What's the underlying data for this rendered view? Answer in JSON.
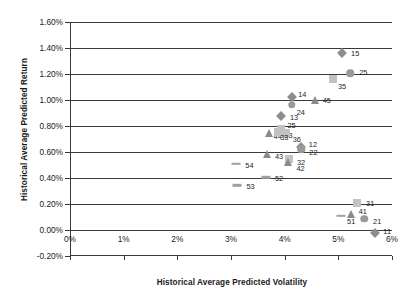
{
  "chart_data": {
    "type": "scatter",
    "title": "",
    "xlabel": "Historical Average Predicted Volatility",
    "ylabel": "Historical Average Predicted Return",
    "xlim": [
      0,
      6
    ],
    "ylim": [
      -0.2,
      1.6
    ],
    "xticks": [
      "0%",
      "1%",
      "2%",
      "3%",
      "4%",
      "5%",
      "6%"
    ],
    "xtick_values": [
      0,
      1,
      2,
      3,
      4,
      5,
      6
    ],
    "yticks": [
      "1.60%",
      "1.40%",
      "1.20%",
      "1.00%",
      "0.80%",
      "0.60%",
      "0.40%",
      "0.20%",
      "0.00%",
      "-0.20%"
    ],
    "ytick_values": [
      1.6,
      1.4,
      1.2,
      1.0,
      0.8,
      0.6,
      0.4,
      0.2,
      0.0,
      -0.2
    ],
    "grid": "horizontal",
    "legend": "none",
    "marker_shapes": {
      "1": "diamond",
      "2": "circle",
      "3": "square",
      "4": "triangle",
      "5": "dash"
    },
    "points": [
      {
        "label": "15",
        "x": 5.07,
        "y": 1.365,
        "shape": "diamond",
        "label_dx": 9,
        "label_dy": 0
      },
      {
        "label": "25",
        "x": 5.22,
        "y": 1.205,
        "shape": "circle",
        "label_dx": 9,
        "label_dy": -1
      },
      {
        "label": "35",
        "x": 4.9,
        "y": 1.16,
        "shape": "square",
        "label_dx": 5,
        "label_dy": 7
      },
      {
        "label": "14",
        "x": 4.14,
        "y": 1.02,
        "shape": "diamond",
        "label_dx": 6,
        "label_dy": -3
      },
      {
        "label": "45",
        "x": 4.56,
        "y": 1.0,
        "shape": "triangle",
        "label_dx": 8,
        "label_dy": 0
      },
      {
        "label": "24",
        "x": 4.13,
        "y": 0.965,
        "shape": "circle",
        "label_dx": 5,
        "label_dy": 7
      },
      {
        "label": "13",
        "x": 3.93,
        "y": 0.88,
        "shape": "diamond",
        "label_dx": 9,
        "label_dy": 1
      },
      {
        "label": "23",
        "x": 3.92,
        "y": 0.765,
        "shape": "circle",
        "label_dx": 4,
        "label_dy": 4
      },
      {
        "label": "25b",
        "x": 3.94,
        "y": 0.775,
        "shape": "square",
        "label_dx": 6,
        "label_dy": -4
      },
      {
        "label": "44",
        "x": 3.7,
        "y": 0.75,
        "shape": "triangle",
        "label_dx": 5,
        "label_dy": 3
      },
      {
        "label": "36",
        "x": 4.02,
        "y": 0.745,
        "shape": "square",
        "label_dx": 7,
        "label_dy": 6
      },
      {
        "label": "33",
        "x": 3.88,
        "y": 0.755,
        "shape": "square",
        "label_dx": 2,
        "label_dy": 5
      },
      {
        "label": "12",
        "x": 4.3,
        "y": 0.635,
        "shape": "diamond",
        "label_dx": 8,
        "label_dy": -3
      },
      {
        "label": "22",
        "x": 4.31,
        "y": 0.62,
        "shape": "circle",
        "label_dx": 8,
        "label_dy": 3
      },
      {
        "label": "43",
        "x": 3.67,
        "y": 0.585,
        "shape": "triangle",
        "label_dx": 8,
        "label_dy": 2
      },
      {
        "label": "32",
        "x": 4.08,
        "y": 0.545,
        "shape": "square",
        "label_dx": 8,
        "label_dy": 3
      },
      {
        "label": "42",
        "x": 4.07,
        "y": 0.525,
        "shape": "triangle",
        "label_dx": 8,
        "label_dy": 6
      },
      {
        "label": "54",
        "x": 3.1,
        "y": 0.51,
        "shape": "dash",
        "label_dx": 9,
        "label_dy": 1
      },
      {
        "label": "52",
        "x": 3.65,
        "y": 0.405,
        "shape": "dash",
        "label_dx": 9,
        "label_dy": 1
      },
      {
        "label": "53",
        "x": 3.12,
        "y": 0.345,
        "shape": "dash",
        "label_dx": 9,
        "label_dy": 1
      },
      {
        "label": "31",
        "x": 5.35,
        "y": 0.205,
        "shape": "square",
        "label_dx": 9,
        "label_dy": 0
      },
      {
        "label": "41",
        "x": 5.23,
        "y": 0.125,
        "shape": "triangle",
        "label_dx": 8,
        "label_dy": -3
      },
      {
        "label": "51",
        "x": 5.05,
        "y": 0.11,
        "shape": "dash",
        "label_dx": 6,
        "label_dy": 5
      },
      {
        "label": "21",
        "x": 5.48,
        "y": 0.085,
        "shape": "circle",
        "label_dx": 9,
        "label_dy": 2
      },
      {
        "label": "11",
        "x": 5.69,
        "y": -0.025,
        "shape": "diamond",
        "label_dx": 8,
        "label_dy": -2
      }
    ]
  }
}
